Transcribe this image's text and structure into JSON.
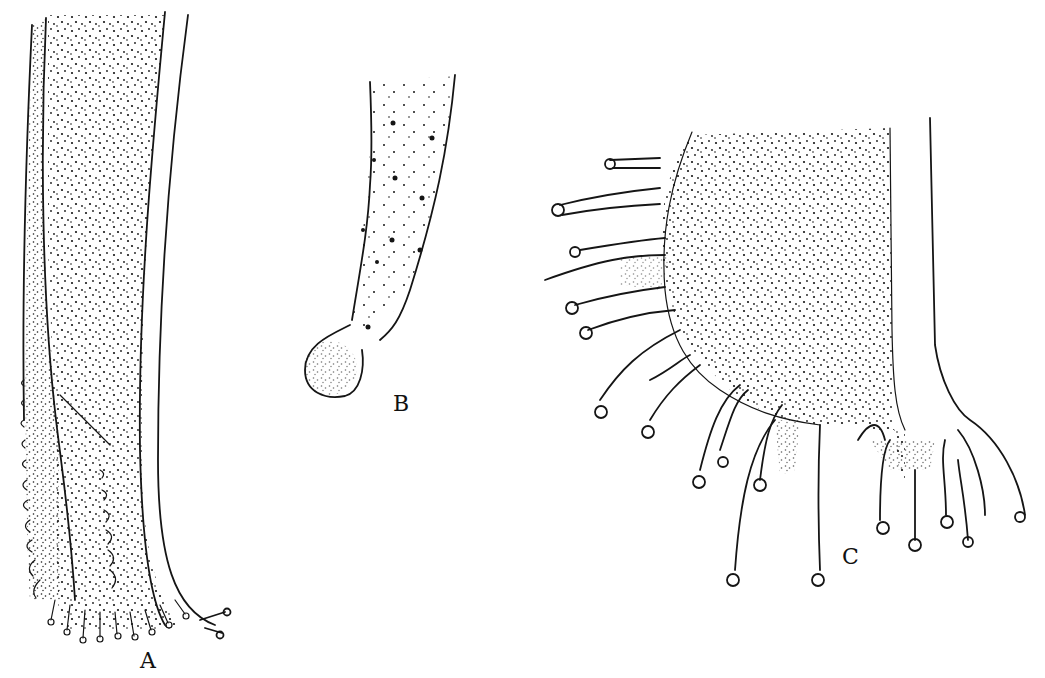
{
  "figure": {
    "background": "#ffffff",
    "ink_color": "#151515",
    "panels": [
      {
        "id": "A",
        "label": "A",
        "description": "Elongated stippled tubular structure with fringed, finger-like marginal processes at its lower end"
      },
      {
        "id": "B",
        "label": "B",
        "description": "Slender curved stalk with scattered dotted clusters terminating in a rounded stippled knob"
      },
      {
        "id": "C",
        "label": "C",
        "description": "Broad stippled body bearing numerous radiating club-tipped tentacle-like processes"
      }
    ]
  }
}
